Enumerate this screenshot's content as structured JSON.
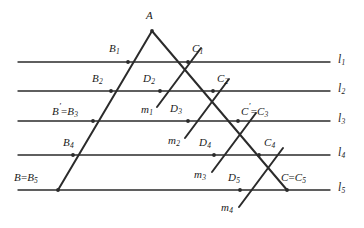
{
  "figure": {
    "stroke_color": "#2b2b2b",
    "label_color": "#1a1a1a",
    "background_color": "#ffffff",
    "line_width": 1.3
  },
  "parallel_lines": [
    {
      "name": "l1",
      "label": "l",
      "sub": "1",
      "y": 62
    },
    {
      "name": "l2",
      "label": "l",
      "sub": "2",
      "y": 91
    },
    {
      "name": "l3",
      "label": "l",
      "sub": "3",
      "y": 121
    },
    {
      "name": "l4",
      "label": "l",
      "sub": "4",
      "y": 155
    },
    {
      "name": "l5",
      "label": "l",
      "sub": "5",
      "y": 190
    }
  ],
  "line_extent": {
    "x_start": 18,
    "x_end": 330
  },
  "triangle": {
    "apex": {
      "name": "A",
      "label": "A",
      "x": 152,
      "y": 31
    },
    "left_base": {
      "name": "B",
      "x": 58,
      "y": 190
    },
    "right_base": {
      "name": "C",
      "x": 287,
      "y": 190
    }
  },
  "point_labels": [
    {
      "name": "label-A",
      "text": "A",
      "sub": "",
      "prime": false,
      "eq": "",
      "x": 146,
      "y": 10
    },
    {
      "name": "label-B1",
      "text": "B",
      "sub": "1",
      "prime": false,
      "eq": "",
      "x": 109,
      "y": 43
    },
    {
      "name": "label-C1",
      "text": "C",
      "sub": "1",
      "prime": false,
      "eq": "",
      "x": 192,
      "y": 43
    },
    {
      "name": "label-B2",
      "text": "B",
      "sub": "2",
      "prime": false,
      "eq": "",
      "x": 92,
      "y": 73
    },
    {
      "name": "label-D2",
      "text": "D",
      "sub": "2",
      "prime": false,
      "eq": "",
      "x": 143,
      "y": 73
    },
    {
      "name": "label-C2",
      "text": "C",
      "sub": "2",
      "prime": false,
      "eq": "",
      "x": 217,
      "y": 73
    },
    {
      "name": "label-m1",
      "text": "m",
      "sub": "1",
      "prime": false,
      "eq": "",
      "x": 141,
      "y": 104
    },
    {
      "name": "label-Bprime",
      "text": "B",
      "sub": "3",
      "prime": true,
      "eq": "=",
      "x": 52,
      "y": 103
    },
    {
      "name": "label-D3",
      "text": "D",
      "sub": "3",
      "prime": false,
      "eq": "",
      "x": 170,
      "y": 103
    },
    {
      "name": "label-Cprime",
      "text": "C",
      "sub": "3",
      "prime": true,
      "eq": "=",
      "x": 241,
      "y": 103
    },
    {
      "name": "label-m2",
      "text": "m",
      "sub": "2",
      "prime": false,
      "eq": "",
      "x": 168,
      "y": 135
    },
    {
      "name": "label-B4",
      "text": "B",
      "sub": "4",
      "prime": false,
      "eq": "",
      "x": 63,
      "y": 137
    },
    {
      "name": "label-D4",
      "text": "D",
      "sub": "4",
      "prime": false,
      "eq": "",
      "x": 199,
      "y": 137
    },
    {
      "name": "label-C4",
      "text": "C",
      "sub": "4",
      "prime": false,
      "eq": "",
      "x": 264,
      "y": 137
    },
    {
      "name": "label-m3",
      "text": "m",
      "sub": "3",
      "prime": false,
      "eq": "",
      "x": 194,
      "y": 169
    },
    {
      "name": "label-B5",
      "text": "B",
      "sub": "5",
      "prime": false,
      "eq": "=",
      "x": 14,
      "y": 172
    },
    {
      "name": "label-D5",
      "text": "D",
      "sub": "5",
      "prime": false,
      "eq": "",
      "x": 228,
      "y": 172
    },
    {
      "name": "label-C5",
      "text": "C",
      "sub": "5",
      "prime": false,
      "eq": "=",
      "x": 281,
      "y": 172
    },
    {
      "name": "label-m4",
      "text": "m",
      "sub": "4",
      "prime": false,
      "eq": "",
      "x": 221,
      "y": 202
    }
  ],
  "segments_AB": [
    {
      "name": "side-AB",
      "x1": 152,
      "y1": 31,
      "x2": 58,
      "y2": 190
    }
  ],
  "segments_AC": [
    {
      "name": "side-AC",
      "x1": 152,
      "y1": 31,
      "x2": 287,
      "y2": 190
    }
  ],
  "transversals_m": [
    {
      "name": "m1",
      "x1": 157,
      "y1": 107,
      "x2": 201,
      "y2": 48
    },
    {
      "name": "m2",
      "x1": 185,
      "y1": 138,
      "x2": 229,
      "y2": 79
    },
    {
      "name": "m3",
      "x1": 212,
      "y1": 172,
      "x2": 256,
      "y2": 113
    },
    {
      "name": "m4",
      "x1": 239,
      "y1": 207,
      "x2": 283,
      "y2": 148
    }
  ],
  "marked_points": [
    {
      "name": "point-A",
      "x": 152,
      "y": 31
    },
    {
      "name": "point-B1",
      "x": 128,
      "y": 62
    },
    {
      "name": "point-C1",
      "x": 188,
      "y": 62
    },
    {
      "name": "point-B2",
      "x": 111,
      "y": 91
    },
    {
      "name": "point-D2",
      "x": 160,
      "y": 91
    },
    {
      "name": "point-C2",
      "x": 213,
      "y": 91
    },
    {
      "name": "point-B3",
      "x": 93,
      "y": 121
    },
    {
      "name": "point-D3",
      "x": 188,
      "y": 121
    },
    {
      "name": "point-C3",
      "x": 238,
      "y": 121
    },
    {
      "name": "point-B4",
      "x": 73,
      "y": 155
    },
    {
      "name": "point-D4",
      "x": 214,
      "y": 155
    },
    {
      "name": "point-C4",
      "x": 259,
      "y": 155
    },
    {
      "name": "point-B5",
      "x": 58,
      "y": 190
    },
    {
      "name": "point-D5",
      "x": 240,
      "y": 190
    },
    {
      "name": "point-C5",
      "x": 287,
      "y": 190
    }
  ]
}
